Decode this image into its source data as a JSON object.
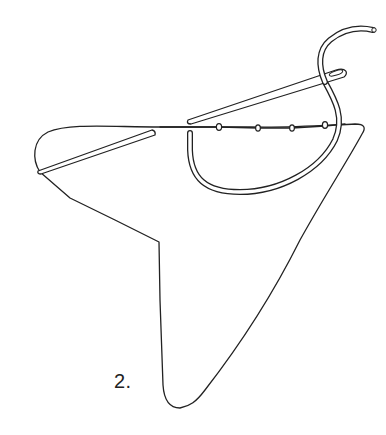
{
  "figure": {
    "step_label": "2.",
    "colors": {
      "background": "#ffffff",
      "ink": "#222222"
    },
    "elements": {
      "fabric": "triangular fabric piece with folded top edge",
      "left_needle": "needle inserted through left fabric fold",
      "right_needle": "needle with eye near the upper right, threaded",
      "thread": "thick thread looping from upper right down around under the seam",
      "stitches": 4
    }
  }
}
